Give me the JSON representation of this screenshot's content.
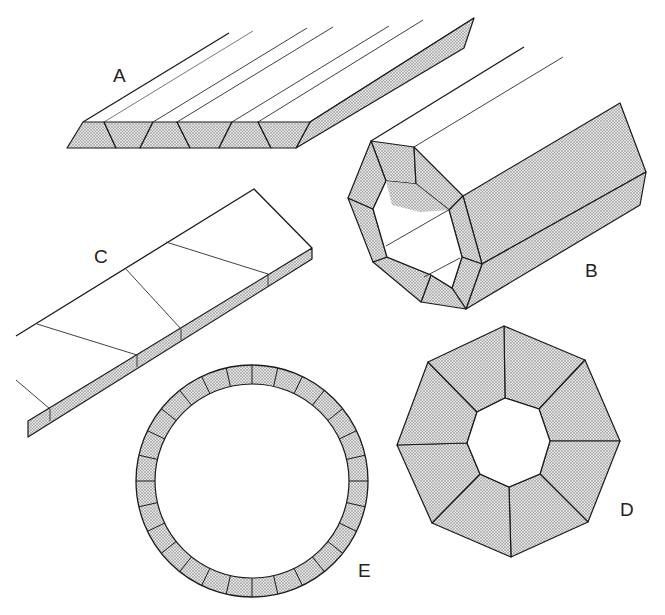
{
  "figure": {
    "labels": {
      "A": "A",
      "B": "B",
      "C": "C",
      "D": "D",
      "E": "E"
    },
    "colors": {
      "line": "#1a1a1a",
      "stipple_dot": "#6e6e6e",
      "background": "#ffffff"
    },
    "parts": [
      {
        "id": "A",
        "shape": "flat slab of alternating trapezoidal segments",
        "segments": 7
      },
      {
        "id": "B",
        "shape": "hollow octagonal tube in perspective",
        "segments": 8
      },
      {
        "id": "C",
        "shape": "flat slab with oblique joints",
        "segments": 4
      },
      {
        "id": "D",
        "shape": "octagonal ring, octagonal hole",
        "segments": 8
      },
      {
        "id": "E",
        "shape": "circular ring of segments",
        "segments": 28
      }
    ]
  }
}
